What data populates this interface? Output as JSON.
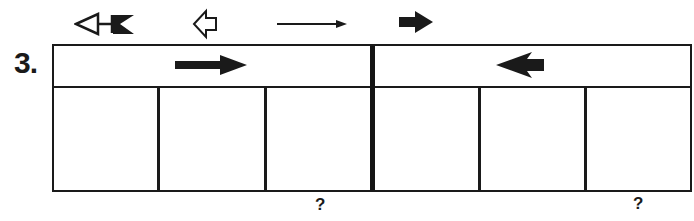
{
  "problem": {
    "number_label": "3.",
    "legend_icons": [
      {
        "name": "left-arrow-with-flag-icon",
        "description": "outlined left-pointing triangle with black flag tail"
      },
      {
        "name": "open-left-arrow-icon",
        "description": "outlined hollow left-pointing arrow"
      },
      {
        "name": "thin-right-arrow-icon",
        "description": "thin long right-pointing arrow"
      },
      {
        "name": "bold-right-arrow-icon",
        "description": "solid black short right-pointing arrow"
      }
    ],
    "panels": [
      {
        "id": "left",
        "header_arrow": {
          "name": "right-arrow-icon",
          "direction": "right",
          "style": "solid"
        },
        "cells": [
          "",
          "",
          ""
        ],
        "question_under_cell": 3,
        "question_mark": "?"
      },
      {
        "id": "right",
        "header_arrow": {
          "name": "left-arrow-icon",
          "direction": "left",
          "style": "solid-notched"
        },
        "cells": [
          "",
          "",
          ""
        ],
        "question_under_cell": 3,
        "question_mark": "?"
      }
    ]
  },
  "colors": {
    "ink": "#1a1a1a",
    "background": "#ffffff"
  }
}
